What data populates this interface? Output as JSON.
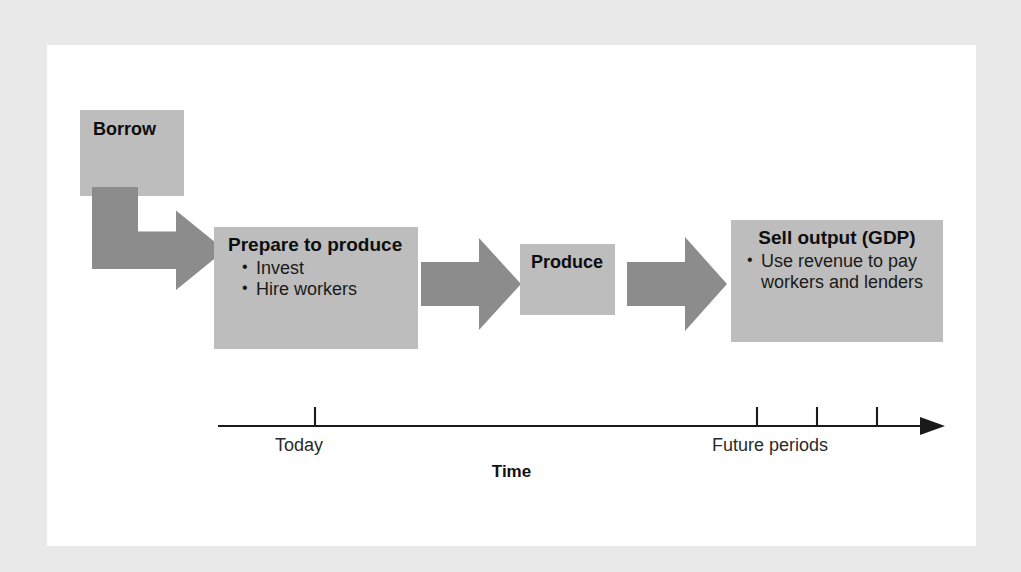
{
  "figure": {
    "background_color": "#e9e9e9",
    "panel_color": "#ffffff",
    "box_color": "#bdbdbd",
    "arrow_color": "#8c8c8c",
    "axis_color": "#1a1a1a"
  },
  "boxes": {
    "borrow": {
      "title": "Borrow",
      "bullets": []
    },
    "prepare": {
      "title": "Prepare to produce",
      "bullets": [
        "Invest",
        "Hire workers"
      ]
    },
    "produce": {
      "title": "Produce",
      "bullets": []
    },
    "sell": {
      "title": "Sell output (GDP)",
      "bullets": [
        "Use revenue to pay workers and lenders"
      ]
    }
  },
  "bullet_glyph": "•",
  "timeline": {
    "axis_label": "Time",
    "today_label": "Today",
    "future_label": "Future periods",
    "tick_count": 4
  }
}
